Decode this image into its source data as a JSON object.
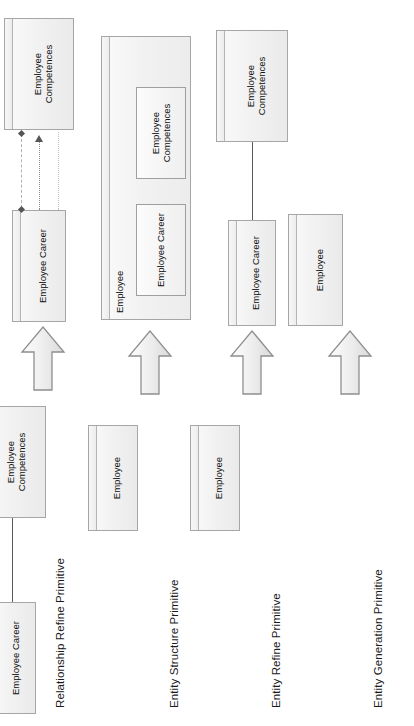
{
  "diagram": {
    "orientation": "rotated-90-ccw",
    "colors": {
      "entity_border": "#a6a6a6",
      "entity_fill": "#f2f2f2",
      "arrow_fill": "#e3e3e3",
      "arrow_border": "#8c8c8c",
      "connector": "#595959",
      "text": "#111111"
    }
  },
  "rows": [
    {
      "label": "Entity Generation Primitive",
      "source": {
        "entities": [],
        "connectors": []
      },
      "arrow": "block-arrow-right",
      "target": {
        "entities": [
          {
            "name": "Employee"
          }
        ],
        "connectors": []
      }
    },
    {
      "label": "Entity Refine  Primitive",
      "source": {
        "entities": [
          {
            "name": "Employee"
          }
        ],
        "connectors": []
      },
      "arrow": "block-arrow-right",
      "target": {
        "entities": [
          {
            "name": "Employee Career"
          },
          {
            "name": "Employee\nCompetences"
          }
        ],
        "connectors": [
          {
            "style": "solid",
            "from": "Employee Career",
            "to": "Employee Competences"
          }
        ]
      }
    },
    {
      "label": "Entity Structure Primitive",
      "source": {
        "entities": [
          {
            "name": "Employee"
          }
        ],
        "connectors": []
      },
      "arrow": "block-arrow-right",
      "target": {
        "entities": [
          {
            "name": "Employee",
            "container": true,
            "children": [
              {
                "name": "Employee Career"
              },
              {
                "name": "Employee\nCompetences"
              }
            ]
          }
        ],
        "connectors": []
      }
    },
    {
      "label": "Relationship Refine Primitive",
      "source": {
        "entities": [
          {
            "name": "Employee Career"
          },
          {
            "name": "Employee\nCompetences"
          }
        ],
        "connectors": [
          {
            "style": "solid",
            "from": "Employee Career",
            "to": "Employee Competences"
          }
        ]
      },
      "arrow": "block-arrow-right",
      "target": {
        "entities": [
          {
            "name": "Employee Career"
          },
          {
            "name": "Employee\nCompetences"
          }
        ],
        "connectors": [
          {
            "style": "dotted-light",
            "from": "Employee Career",
            "to": "Employee Competences"
          },
          {
            "style": "dotted-arrow",
            "from": "Employee Career",
            "to": "Employee Competences"
          },
          {
            "style": "dashed-diamond",
            "from": "Employee Career",
            "to": "Employee Competences"
          }
        ]
      }
    }
  ]
}
